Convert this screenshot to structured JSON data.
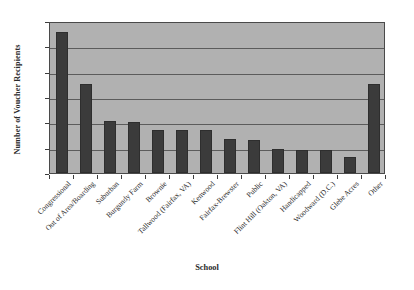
{
  "chart_data": {
    "type": "bar",
    "title": "",
    "xlabel": "School",
    "ylabel": "Number of Voucher Recipients",
    "categories": [
      "Congressional",
      "Out of Area/Boarding",
      "Suburban",
      "Burgundy Farm",
      "Brownie",
      "Tallwood (Fairfax, VA)",
      "Kenwood",
      "Fairfax-Brewster",
      "Public",
      "Flint Hill (Oakton, VA)",
      "Handicapped",
      "Woodward (D.C.)",
      "Glebe Acres",
      "Other"
    ],
    "values": [
      111,
      70,
      41,
      40,
      34,
      34,
      34,
      27,
      26,
      19,
      18,
      18,
      13,
      70
    ],
    "ylim": [
      0,
      120
    ],
    "yticks": [
      0,
      20,
      40,
      60,
      80,
      100,
      120
    ],
    "ytick_labels": [
      "0",
      "20",
      "40",
      "60",
      "80",
      "100",
      "120"
    ],
    "grid": true,
    "gridlines_at": [
      20,
      40,
      60,
      80,
      100
    ],
    "legend": null,
    "bar_color": "#3b3b3b",
    "plot_background": "#b1b1b1",
    "figure_background": "#ffffff",
    "axis_color": "#4a4a4a",
    "gridline_color": "#5c5c5c"
  }
}
